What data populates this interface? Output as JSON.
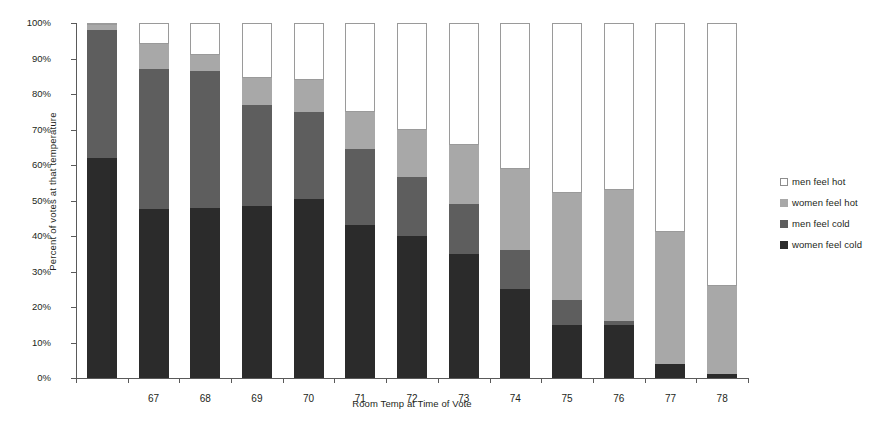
{
  "chart_data": {
    "type": "bar",
    "subtype": "stacked-percent",
    "title": "",
    "xlabel": "Room Temp at Time of Vote",
    "ylabel": "Percent of votes at that temperature",
    "ylim": [
      0,
      100
    ],
    "ytick_labels": [
      "0%",
      "10%",
      "20%",
      "30%",
      "40%",
      "50%",
      "60%",
      "70%",
      "80%",
      "90%",
      "100%"
    ],
    "ytick_values": [
      0,
      10,
      20,
      30,
      40,
      50,
      60,
      70,
      80,
      90,
      100
    ],
    "grid": false,
    "legend_position": "right",
    "categories": [
      "",
      "67",
      "68",
      "69",
      "70",
      "71",
      "72",
      "73",
      "74",
      "75",
      "76",
      "77",
      "78"
    ],
    "series": [
      {
        "name": "women feel cold",
        "color": "#2b2b2b",
        "values": [
          62,
          47.5,
          48,
          48.5,
          50.5,
          43,
          40,
          35,
          25,
          15,
          15,
          4,
          1
        ]
      },
      {
        "name": "men feel cold",
        "color": "#5e5e5e",
        "values": [
          36,
          39.5,
          38.5,
          28.5,
          24.5,
          21.5,
          16.5,
          14,
          11,
          7,
          1,
          0,
          0
        ]
      },
      {
        "name": "women feel hot",
        "color": "#a8a8a8",
        "values": [
          1.5,
          7,
          4.5,
          7.5,
          9,
          10.5,
          13.5,
          16.5,
          23,
          30,
          37,
          37,
          25
        ]
      },
      {
        "name": "men feel hot",
        "color": "#ffffff",
        "values": [
          0.5,
          6,
          9,
          15.5,
          16,
          25,
          30,
          34.5,
          41,
          48,
          47,
          59,
          74
        ]
      }
    ]
  },
  "legend": {
    "items": [
      {
        "label": "men feel hot",
        "swatch": "s-menhot"
      },
      {
        "label": "women feel hot",
        "swatch": "s-womenhot"
      },
      {
        "label": "men feel cold",
        "swatch": "s-mencold"
      },
      {
        "label": "women feel cold",
        "swatch": "s-womencold"
      }
    ]
  }
}
